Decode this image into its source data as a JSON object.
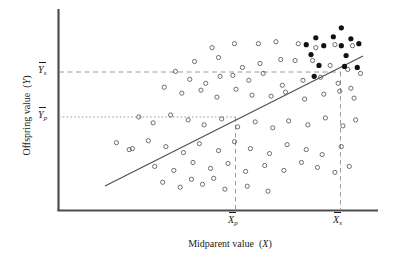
{
  "figure": {
    "type": "scatter-regression-plot",
    "background_color": "#ffffff"
  },
  "axes": {
    "x_title": "Midparent value (X)",
    "y_title": "Offspring value (Y)",
    "x_title_text": "Midparent value",
    "x_title_var": "X",
    "y_title_text": "Offspring value",
    "y_title_var": "Y",
    "axis_color": "#4d4d4d"
  },
  "tick_labels": {
    "y_upper": "Y",
    "y_upper_sub": "s",
    "y_lower": "Y",
    "y_lower_sub": "p",
    "x_left": "X",
    "x_left_sub": "p",
    "x_right": "X",
    "x_right_sub": "s"
  },
  "reference_lines": {
    "y_s_style": "dashed",
    "y_p_style": "dotted",
    "x_p_style": "dotted",
    "x_s_style": "dashed",
    "color": "#8c8c8c"
  },
  "legend": {
    "open_marker": "unselected offspring",
    "filled_marker": "selected offspring"
  },
  "chart_data": {
    "type": "scatter",
    "title": "",
    "xlabel": "Midparent value (X)",
    "ylabel": "Offspring value (Y)",
    "xlim": [
      0,
      100
    ],
    "ylim": [
      0,
      100
    ],
    "grid": false,
    "legend_position": "none",
    "annotations": [
      {
        "label": "Y_s",
        "axis": "y",
        "value": 71.5,
        "style": "dashed"
      },
      {
        "label": "Y_p",
        "axis": "y",
        "value": 46.5,
        "style": "dotted"
      },
      {
        "label": "X_p",
        "axis": "x",
        "value": 55.3,
        "style": "dotted"
      },
      {
        "label": "X_s",
        "axis": "x",
        "value": 88.1,
        "style": "dashed"
      }
    ],
    "regression_line": {
      "x0": 14.7,
      "y0": 18.0,
      "x1": 95.0,
      "y1": 78.5,
      "color": "#4d4d4d"
    },
    "series": [
      {
        "name": "unselected",
        "marker": "open-circle",
        "color": "#555555",
        "points": [
          [
            48.0,
            82.0
          ],
          [
            55.0,
            84.0
          ],
          [
            62.5,
            84.0
          ],
          [
            68.0,
            85.0
          ],
          [
            75.0,
            84.0
          ],
          [
            80.5,
            82.0
          ],
          [
            86.5,
            83.5
          ],
          [
            92.0,
            83.0
          ],
          [
            42.5,
            75.0
          ],
          [
            50.0,
            77.0
          ],
          [
            57.5,
            72.0
          ],
          [
            63.0,
            74.0
          ],
          [
            69.5,
            76.0
          ],
          [
            74.0,
            75.5
          ],
          [
            79.5,
            75.5
          ],
          [
            85.0,
            73.0
          ],
          [
            90.5,
            71.0
          ],
          [
            94.5,
            69.0
          ],
          [
            36.5,
            70.0
          ],
          [
            41.0,
            66.0
          ],
          [
            46.0,
            64.0
          ],
          [
            50.5,
            67.5
          ],
          [
            54.5,
            68.0
          ],
          [
            59.5,
            65.5
          ],
          [
            64.0,
            69.0
          ],
          [
            70.0,
            63.0
          ],
          [
            76.5,
            65.5
          ],
          [
            82.0,
            67.0
          ],
          [
            87.5,
            64.0
          ],
          [
            91.5,
            61.5
          ],
          [
            33.0,
            62.0
          ],
          [
            38.5,
            59.0
          ],
          [
            44.5,
            60.5
          ],
          [
            49.5,
            57.0
          ],
          [
            55.5,
            61.0
          ],
          [
            60.5,
            58.0
          ],
          [
            66.5,
            57.5
          ],
          [
            71.0,
            59.5
          ],
          [
            77.0,
            56.0
          ],
          [
            83.0,
            58.5
          ],
          [
            88.0,
            60.0
          ],
          [
            92.5,
            56.5
          ],
          [
            25.0,
            47.0
          ],
          [
            29.5,
            44.0
          ],
          [
            35.0,
            48.0
          ],
          [
            40.5,
            45.5
          ],
          [
            45.5,
            43.0
          ],
          [
            51.0,
            46.0
          ],
          [
            56.0,
            42.0
          ],
          [
            61.5,
            44.5
          ],
          [
            67.0,
            41.5
          ],
          [
            72.0,
            45.0
          ],
          [
            78.0,
            43.0
          ],
          [
            83.5,
            46.5
          ],
          [
            89.0,
            42.5
          ],
          [
            93.0,
            45.5
          ],
          [
            18.0,
            34.0
          ],
          [
            23.0,
            31.0
          ],
          [
            22.0,
            30.5
          ],
          [
            28.0,
            35.0
          ],
          [
            33.5,
            32.0
          ],
          [
            39.0,
            29.0
          ],
          [
            44.0,
            33.5
          ],
          [
            50.0,
            30.0
          ],
          [
            55.0,
            34.5
          ],
          [
            60.0,
            31.0
          ],
          [
            66.0,
            28.5
          ],
          [
            71.5,
            33.0
          ],
          [
            77.5,
            30.5
          ],
          [
            82.5,
            28.0
          ],
          [
            88.5,
            32.0
          ],
          [
            30.0,
            22.0
          ],
          [
            36.0,
            20.0
          ],
          [
            42.0,
            24.0
          ],
          [
            47.5,
            21.0
          ],
          [
            53.0,
            23.5
          ],
          [
            58.5,
            19.5
          ],
          [
            64.5,
            22.5
          ],
          [
            70.5,
            20.0
          ],
          [
            76.0,
            24.0
          ],
          [
            81.0,
            21.5
          ],
          [
            86.5,
            19.0
          ],
          [
            91.0,
            22.0
          ],
          [
            32.5,
            14.0
          ],
          [
            38.0,
            11.5
          ],
          [
            45.0,
            13.0
          ],
          [
            52.0,
            10.5
          ],
          [
            59.0,
            12.0
          ],
          [
            41.5,
            15.5
          ],
          [
            48.5,
            16.0
          ],
          [
            65.5,
            9.5
          ]
        ]
      },
      {
        "name": "selected",
        "marker": "filled-circle",
        "color": "#111111",
        "points": [
          [
            88.5,
            92.0
          ],
          [
            80.5,
            87.0
          ],
          [
            86.0,
            87.5
          ],
          [
            91.5,
            86.5
          ],
          [
            77.5,
            83.5
          ],
          [
            83.0,
            83.0
          ],
          [
            88.5,
            83.0
          ],
          [
            94.0,
            84.0
          ],
          [
            79.0,
            78.5
          ],
          [
            90.0,
            78.0
          ],
          [
            81.5,
            73.0
          ],
          [
            89.5,
            72.5
          ],
          [
            93.5,
            72.0
          ],
          [
            80.0,
            67.5
          ]
        ]
      }
    ]
  }
}
